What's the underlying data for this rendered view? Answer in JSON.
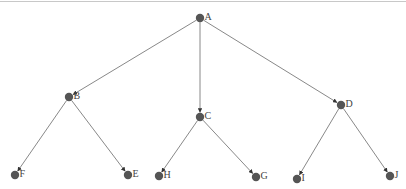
{
  "diagram": {
    "type": "tree",
    "nodes": [
      {
        "id": "A",
        "label": "A",
        "x": 200,
        "y": 18
      },
      {
        "id": "B",
        "label": "B",
        "x": 69,
        "y": 97
      },
      {
        "id": "C",
        "label": "C",
        "x": 200,
        "y": 117
      },
      {
        "id": "D",
        "label": "D",
        "x": 341,
        "y": 105
      },
      {
        "id": "F",
        "label": "F",
        "x": 15,
        "y": 175
      },
      {
        "id": "E",
        "label": "E",
        "x": 128,
        "y": 175
      },
      {
        "id": "H",
        "label": "H",
        "x": 159,
        "y": 176
      },
      {
        "id": "G",
        "label": "G",
        "x": 256,
        "y": 177
      },
      {
        "id": "I",
        "label": "I",
        "x": 297,
        "y": 179
      },
      {
        "id": "J",
        "label": "J",
        "x": 390,
        "y": 176
      }
    ],
    "edges": [
      {
        "from": "A",
        "to": "B"
      },
      {
        "from": "A",
        "to": "C"
      },
      {
        "from": "A",
        "to": "D"
      },
      {
        "from": "B",
        "to": "F"
      },
      {
        "from": "B",
        "to": "E"
      },
      {
        "from": "C",
        "to": "H"
      },
      {
        "from": "C",
        "to": "G"
      },
      {
        "from": "D",
        "to": "I"
      },
      {
        "from": "D",
        "to": "J"
      }
    ],
    "colors": {
      "node": "#555555",
      "edge": "#7a7a7a",
      "label": "#444444"
    }
  }
}
